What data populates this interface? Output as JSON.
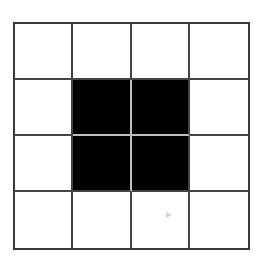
{
  "board": {
    "rows": 4,
    "cols": 4,
    "cells": [
      [
        0,
        0,
        0,
        0
      ],
      [
        0,
        1,
        1,
        0
      ],
      [
        0,
        1,
        1,
        0
      ],
      [
        0,
        0,
        0,
        0
      ]
    ],
    "colors": {
      "filled": "#000000",
      "empty": "#ffffff",
      "grid_line": "#444444"
    }
  }
}
